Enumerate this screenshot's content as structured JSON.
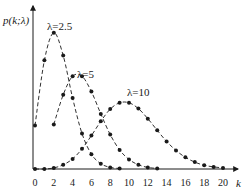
{
  "chart_data": {
    "type": "line",
    "title": "",
    "xlabel": "k",
    "ylabel": "p(k;λ)",
    "x_ticks": [
      0,
      2,
      4,
      6,
      8,
      10,
      12,
      14,
      16,
      18,
      20
    ],
    "xlim": [
      0,
      21
    ],
    "grid": false,
    "legend": "inline annotations",
    "x": [
      0,
      1,
      2,
      3,
      4,
      5,
      6,
      7,
      8,
      9,
      10,
      11,
      12,
      13,
      14,
      15,
      16,
      17,
      18,
      19,
      20
    ],
    "series": [
      {
        "name": "λ=2.5",
        "label": "λ=2.5",
        "style": "dashed with dot markers",
        "x": [
          0,
          1,
          2,
          3,
          4,
          5,
          6,
          7,
          8,
          9
        ],
        "values": [
          0.082,
          0.205,
          0.257,
          0.214,
          0.134,
          0.067,
          0.028,
          0.01,
          0.003,
          0.001
        ]
      },
      {
        "name": "λ=5",
        "label": "λ=5",
        "style": "dashed with dot markers",
        "x": [
          2,
          3,
          4,
          5,
          6,
          7,
          8,
          9,
          10,
          11,
          12,
          13
        ],
        "values": [
          0.084,
          0.14,
          0.175,
          0.175,
          0.146,
          0.104,
          0.065,
          0.036,
          0.018,
          0.008,
          0.003,
          0.001
        ]
      },
      {
        "name": "λ=10",
        "label": "λ=10",
        "style": "dashed with dot markers",
        "x": [
          0,
          1,
          2,
          3,
          4,
          5,
          6,
          7,
          8,
          9,
          10,
          11,
          12,
          13,
          14,
          15,
          16,
          17,
          18,
          19,
          20
        ],
        "values": [
          0.0,
          0.0,
          0.002,
          0.008,
          0.019,
          0.038,
          0.063,
          0.09,
          0.113,
          0.125,
          0.125,
          0.114,
          0.095,
          0.073,
          0.052,
          0.035,
          0.022,
          0.013,
          0.007,
          0.004,
          0.002
        ]
      }
    ]
  },
  "labels": {
    "ylabel": "p(k;λ)",
    "xlabel": "k",
    "series_0": "λ=2.5",
    "series_1": "λ=5",
    "series_2": "λ=10"
  },
  "colors": {
    "line": "#1a1a1a",
    "axis": "#1a1a1a",
    "background": "#ffffff"
  }
}
